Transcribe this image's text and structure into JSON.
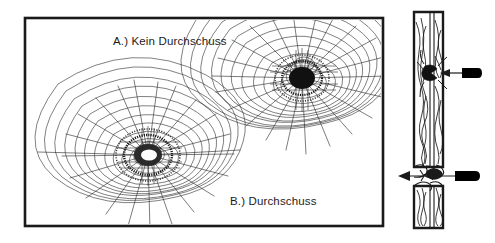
{
  "figure": {
    "name": "glass-impact-comparison-figure",
    "background_color": "#ffffff",
    "stroke_color": "#1a1a1a",
    "width": 495,
    "height": 243
  },
  "left_panel": {
    "name": "frontal-view-panel",
    "border_color": "#1a1a1a",
    "x": 25,
    "y": 18,
    "width": 358,
    "height": 208,
    "labels": {
      "a": "A.) Kein Durchschuss",
      "b": "B.) Durchschuss"
    },
    "impacts": [
      {
        "id": "impact-a",
        "label_ref": "A.) Kein Durchschuss",
        "center_x": 302,
        "center_y": 78,
        "core_color": "#111111",
        "core_type": "opaque-dark-center",
        "radial_cracks": 22,
        "concentric_rings": 11,
        "outer_radius": 88,
        "penetrated": false
      },
      {
        "id": "impact-b",
        "label_ref": "B.) Durchschuss",
        "center_x": 148,
        "center_y": 155,
        "core_color": "#ffffff",
        "core_type": "open-hole-center",
        "radial_cracks": 24,
        "concentric_rings": 11,
        "outer_radius": 82,
        "penetrated": true
      }
    ]
  },
  "right_panel": {
    "name": "cross-section-panel",
    "glass_x": 414,
    "glass_width": 29,
    "glass_top": 12,
    "glass_bottom": 228,
    "interlayer_offset": 14,
    "stroke_color": "#1a1a1a",
    "projectiles": [
      {
        "id": "projectile-a",
        "name": "non-penetrating-projectile",
        "body_x": 462,
        "body_y": 68,
        "body_width": 20,
        "body_height": 10,
        "color": "#000000",
        "arrow_direction": "left",
        "arrow_tip_x": 446,
        "arrow_y": 73,
        "penetrated": false,
        "crater_y": 73
      },
      {
        "id": "projectile-b",
        "name": "penetrating-projectile",
        "body_x": 455,
        "body_y": 171,
        "body_width": 25,
        "body_height": 10,
        "color": "#000000",
        "arrow_direction": "left",
        "arrow_tip_x": 398,
        "arrow_y": 176,
        "penetrated": true,
        "crater_y": 176,
        "break_gap_top": 166,
        "break_gap_bottom": 186
      }
    ]
  }
}
